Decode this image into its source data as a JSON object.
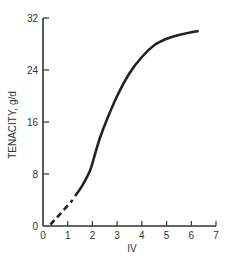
{
  "chart_data": {
    "type": "line",
    "title": "",
    "xlabel": "IV",
    "ylabel": "TENACITY, g/d",
    "xlim": [
      0,
      7
    ],
    "ylim": [
      0,
      32
    ],
    "xticks": [
      0,
      1,
      2,
      3,
      4,
      5,
      6,
      7
    ],
    "yticks": [
      0,
      8,
      16,
      24,
      32
    ],
    "grid": false,
    "legend": null,
    "series": [
      {
        "name": "extrapolated",
        "style": "dashed",
        "color": "#222222",
        "x": [
          0.3,
          1.2
        ],
        "y": [
          0.2,
          4.0
        ]
      },
      {
        "name": "measured",
        "style": "solid",
        "color": "#222222",
        "x": [
          1.3,
          1.6,
          1.9,
          2.1,
          2.3,
          2.6,
          3.0,
          3.5,
          4.0,
          4.5,
          5.0,
          5.5,
          6.0,
          6.3
        ],
        "y": [
          4.6,
          6.3,
          8.5,
          11.0,
          13.5,
          16.5,
          20.0,
          23.5,
          26.0,
          27.8,
          28.8,
          29.4,
          29.8,
          30.0
        ]
      }
    ]
  }
}
